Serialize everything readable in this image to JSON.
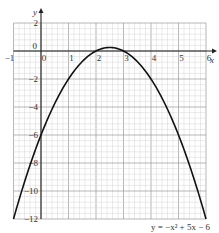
{
  "chart_data": {
    "type": "line",
    "title": "",
    "xlabel": "x",
    "ylabel": "y",
    "xlim": [
      -1,
      6
    ],
    "ylim": [
      -12,
      2
    ],
    "x_ticks": [
      -1,
      0,
      1,
      2,
      3,
      4,
      5,
      6
    ],
    "y_ticks": [
      2,
      0,
      -2,
      -4,
      -6,
      -8,
      -10,
      -12
    ],
    "grid": true,
    "series": [
      {
        "name": "y = −x² + 5x − 6",
        "equation": "y = -x^2 + 5x - 6",
        "x": [
          -1,
          -0.5,
          0,
          0.5,
          1,
          1.5,
          2,
          2.5,
          3,
          3.5,
          4,
          4.5,
          5,
          5.5,
          6
        ],
        "y": [
          -12,
          -8.75,
          -6,
          -3.75,
          -2,
          -0.75,
          0,
          0.25,
          0,
          -0.75,
          -2,
          -3.75,
          -6,
          -8.75,
          -12
        ]
      }
    ],
    "annotations": [
      {
        "text": "y = −x² + 5x − 6",
        "position": "bottom-right"
      }
    ],
    "colors": {
      "curve": "#111111",
      "axis": "#222222",
      "grid_major": "#9a9a9a",
      "grid_minor": "#d4d4d4"
    }
  },
  "labels": {
    "x_axis": "x",
    "y_axis": "y",
    "equation": "y = −x² + 5x − 6"
  }
}
